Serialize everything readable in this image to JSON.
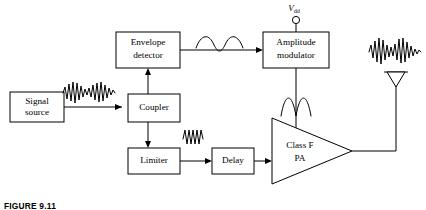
{
  "figure": {
    "caption": "FIGURE 9.11"
  },
  "blocks": [
    {
      "id": "signal-source",
      "label_line1": "Signal",
      "label_line2": "source",
      "x": 10,
      "y": 92,
      "w": 54,
      "h": 30
    },
    {
      "id": "envelope-detector",
      "label_line1": "Envelope",
      "label_line2": "detector",
      "x": 116,
      "y": 32,
      "w": 64,
      "h": 36
    },
    {
      "id": "coupler",
      "label_line1": "Coupler",
      "label_line2": "",
      "x": 128,
      "y": 94,
      "w": 52,
      "h": 28
    },
    {
      "id": "limiter",
      "label_line1": "Limiter",
      "label_line2": "",
      "x": 128,
      "y": 148,
      "w": 52,
      "h": 26
    },
    {
      "id": "delay",
      "label_line1": "Delay",
      "label_line2": "",
      "x": 212,
      "y": 148,
      "w": 42,
      "h": 26
    },
    {
      "id": "amplitude-modulator",
      "label_line1": "Amplitude",
      "label_line2": "modulator",
      "x": 263,
      "y": 32,
      "w": 66,
      "h": 36
    }
  ],
  "amplifier": {
    "id": "class-f-pa",
    "label_line1": "Class F",
    "label_line2": "PA",
    "x": 272,
    "y": 118,
    "w": 80,
    "h": 66
  },
  "supply": {
    "label_main": "V",
    "label_sub": "dd",
    "terminal_x": 296,
    "terminal_y": 19
  },
  "antenna": {
    "id": "antenna",
    "x": 396,
    "y": 72
  },
  "waveforms": [
    {
      "id": "modulated-rf-input",
      "kind": "am-rf",
      "x": 62,
      "y": 80,
      "w": 58,
      "h": 26
    },
    {
      "id": "envelope-output",
      "kind": "envelope",
      "x": 196,
      "y": 34,
      "w": 46,
      "h": 18
    },
    {
      "id": "limiter-output",
      "kind": "constant-rf",
      "x": 182,
      "y": 128,
      "w": 26,
      "h": 18
    },
    {
      "id": "pa-drain-waveform",
      "kind": "half-sine-pair",
      "x": 282,
      "y": 94,
      "w": 44,
      "h": 22
    },
    {
      "id": "antenna-output",
      "kind": "am-rf",
      "x": 368,
      "y": 36,
      "w": 56,
      "h": 32
    }
  ],
  "colors": {
    "line": "#000000",
    "background": "#ffffff",
    "text": "#000000"
  }
}
